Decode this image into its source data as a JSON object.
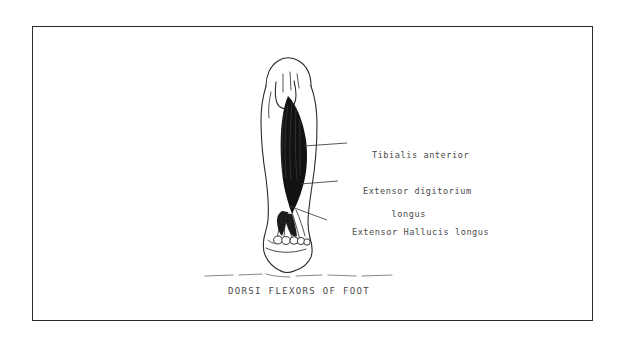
{
  "figure": {
    "title": "DORSI FLEXORS OF FOOT",
    "frame": {
      "border_color": "#2b2b2b",
      "background_color": "#ffffff"
    },
    "ink_color": "#1a1a1a",
    "text_color": "#4a4a4a"
  },
  "labels": [
    {
      "id": "tibialis-anterior",
      "text": "Tibialis anterior",
      "lines": [
        "Tibialis anterior"
      ]
    },
    {
      "id": "extensor-digitorium-longus",
      "text": "Extensor digitorium longus",
      "lines": [
        "Extensor digitorium",
        "     longus"
      ]
    },
    {
      "id": "extensor-hallucis-longus",
      "text": "Extensor Hallucis longus",
      "lines": [
        "Extensor Hallucis longus"
      ]
    }
  ],
  "caption": {
    "text": "DORSI FLEXORS OF FOOT"
  }
}
